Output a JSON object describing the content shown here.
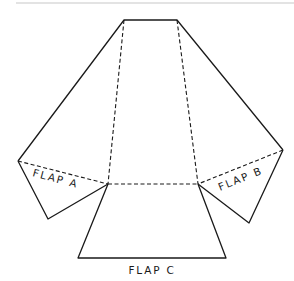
{
  "diagram": {
    "type": "folding-net",
    "labels": {
      "flap_a": "FLAP A",
      "flap_b": "FLAP B",
      "flap_c": "FLAP C"
    },
    "line_color": "#1a1a1a",
    "separator_color": "#c8c8c8"
  }
}
